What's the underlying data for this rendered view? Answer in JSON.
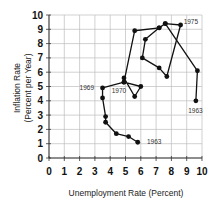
{
  "chart_data": {
    "type": "line",
    "title": "",
    "xlabel": "Unemployment Rate (Percent)",
    "ylabel_lines": [
      "Inflation Rate",
      "(Percent per Year)"
    ],
    "ylabel": "Inflation Rate (Percent per Year)",
    "xlim": [
      0,
      10
    ],
    "ylim": [
      0,
      10
    ],
    "grid": true,
    "x_ticks": [
      "0",
      "1",
      "2",
      "3",
      "4",
      "5",
      "6",
      "7",
      "8",
      "9",
      "10"
    ],
    "y_ticks": [
      "0",
      "1",
      "2",
      "3",
      "4",
      "5",
      "6",
      "7",
      "8",
      "9",
      "10"
    ],
    "series": [
      {
        "name": "Inflation vs Unemployment trajectory",
        "points": [
          [
            5.8,
            1.1
          ],
          [
            5.2,
            1.5
          ],
          [
            4.4,
            1.7
          ],
          [
            3.7,
            2.5
          ],
          [
            3.7,
            2.9
          ],
          [
            3.5,
            4.2
          ],
          [
            3.5,
            4.9
          ],
          [
            4.9,
            5.3
          ],
          [
            4.9,
            5.6
          ],
          [
            5.6,
            4.3
          ],
          [
            6.0,
            5.0
          ],
          [
            4.9,
            5.3
          ],
          [
            5.6,
            8.9
          ],
          [
            7.2,
            9.1
          ],
          [
            7.6,
            9.4
          ],
          [
            9.7,
            6.1
          ],
          [
            9.6,
            4.0
          ]
        ],
        "loop_points": [
          [
            7.2,
            9.1
          ],
          [
            6.3,
            8.3
          ],
          [
            6.1,
            7.0
          ],
          [
            7.2,
            6.3
          ],
          [
            7.7,
            5.7
          ],
          [
            8.6,
            9.3
          ],
          [
            7.6,
            9.4
          ]
        ]
      }
    ],
    "annotations": [
      {
        "text": "1963",
        "x": 6.4,
        "y": 1.1
      },
      {
        "text": "1969",
        "x": 2.0,
        "y": 4.9
      },
      {
        "text": "1970",
        "x": 4.1,
        "y": 4.7
      },
      {
        "text": "1975",
        "x": 8.8,
        "y": 9.5
      },
      {
        "text": "1963",
        "x": 9.1,
        "y": 3.3
      }
    ]
  }
}
